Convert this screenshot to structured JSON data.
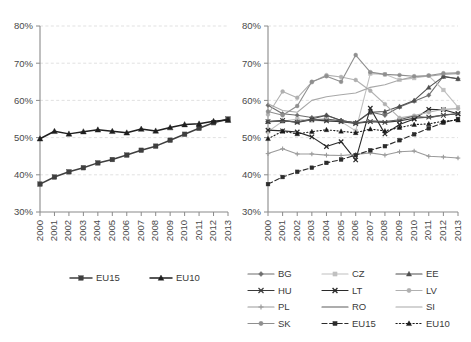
{
  "figure": {
    "background": "#ffffff",
    "axis_color": "#8a8a8a",
    "grid_color": "#d9d9d9"
  },
  "chart_data": [
    {
      "id": "left",
      "type": "line",
      "title": "",
      "xlabel": "",
      "ylabel": "",
      "x": [
        "2000",
        "2001",
        "2002",
        "2003",
        "2004",
        "2005",
        "2006",
        "2007",
        "2008",
        "2009",
        "2010",
        "2011",
        "2012",
        "2013"
      ],
      "ylim": [
        30,
        80
      ],
      "yticks": [
        30,
        40,
        50,
        60,
        70,
        80
      ],
      "ytick_labels": [
        "30%",
        "40%",
        "50%",
        "60%",
        "70%",
        "80%"
      ],
      "grid": true,
      "legend_position": "bottom",
      "series": [
        {
          "name": "EU15",
          "marker": "square",
          "color": "#3f3f3f",
          "dash": "none",
          "values": [
            37.5,
            39.4,
            40.8,
            41.9,
            43.2,
            44.1,
            45.3,
            46.6,
            47.7,
            49.3,
            50.9,
            52.5,
            54.0,
            55.0
          ]
        },
        {
          "name": "EU10",
          "marker": "triangle",
          "color": "#1f1f1f",
          "dash": "none",
          "values": [
            49.7,
            51.7,
            51.0,
            51.6,
            52.1,
            51.7,
            51.3,
            52.3,
            51.8,
            52.7,
            53.5,
            53.7,
            54.4,
            54.7
          ]
        }
      ]
    },
    {
      "id": "right",
      "type": "line",
      "title": "",
      "xlabel": "",
      "ylabel": "",
      "x": [
        "2000",
        "2001",
        "2002",
        "2003",
        "2004",
        "2005",
        "2006",
        "2007",
        "2008",
        "2009",
        "2010",
        "2011",
        "2012",
        "2013"
      ],
      "ylim": [
        30,
        80
      ],
      "yticks": [
        30,
        40,
        50,
        60,
        70,
        80
      ],
      "ytick_labels": [
        "30%",
        "40%",
        "50%",
        "60%",
        "70%",
        "80%"
      ],
      "grid": true,
      "legend_position": "bottom",
      "series": [
        {
          "name": "BG",
          "marker": "diamond",
          "color": "#6e6e6e",
          "dash": "none",
          "values": [
            58.7,
            56.4,
            56.0,
            55.4,
            56.0,
            54.6,
            54.0,
            56.9,
            56.0,
            58.2,
            59.8,
            61.4,
            66.5,
            65.8
          ]
        },
        {
          "name": "CZ",
          "marker": "square",
          "color": "#c0c0c0",
          "dash": "none",
          "values": [
            51.6,
            54.4,
            55.0,
            54.6,
            54.5,
            54.3,
            51.8,
            67.2,
            67.0,
            65.5,
            66.0,
            66.6,
            62.8,
            58.2
          ]
        },
        {
          "name": "EE",
          "marker": "triangle",
          "color": "#4f4f4f",
          "dash": "none",
          "values": [
            54.3,
            54.5,
            54.2,
            55.0,
            56.0,
            54.6,
            54.0,
            56.8,
            57.0,
            58.4,
            60.0,
            63.5,
            66.4,
            65.8
          ]
        },
        {
          "name": "HU",
          "marker": "cross",
          "color": "#3a3a3a",
          "dash": "none",
          "values": [
            54.3,
            54.6,
            54.1,
            54.8,
            54.5,
            54.3,
            53.8,
            54.3,
            54.1,
            54.5,
            55.2,
            55.5,
            56.0,
            56.4
          ]
        },
        {
          "name": "LT",
          "marker": "x",
          "color": "#2a2a2a",
          "dash": "none",
          "values": [
            52.0,
            51.8,
            51.5,
            50.2,
            47.6,
            48.9,
            44.0,
            57.9,
            51.0,
            53.5,
            55.0,
            57.6,
            57.5,
            56.4
          ]
        },
        {
          "name": "LV",
          "marker": "circle",
          "color": "#b0b0b0",
          "dash": "none",
          "values": [
            56.2,
            62.4,
            60.7,
            64.9,
            66.8,
            66.3,
            65.5,
            62.6,
            59.0,
            55.3,
            55.9,
            56.8,
            57.6,
            57.8
          ]
        },
        {
          "name": "PL",
          "marker": "plus",
          "color": "#9a9a9a",
          "dash": "none",
          "values": [
            45.7,
            47.0,
            45.6,
            45.6,
            45.3,
            45.2,
            45.5,
            45.9,
            45.3,
            46.2,
            46.4,
            45.0,
            44.8,
            44.5
          ]
        },
        {
          "name": "RO",
          "marker": "none",
          "color": "#5c5c5c",
          "dash": "none",
          "values": [
            54.3,
            54.4,
            54.3,
            54.8,
            55.0,
            54.5,
            53.9,
            54.5,
            54.3,
            54.8,
            55.8,
            55.3,
            56.1,
            56.4
          ]
        },
        {
          "name": "SI",
          "marker": "none",
          "color": "#a8a8a8",
          "dash": "none",
          "values": [
            59.1,
            57.3,
            56.8,
            60.0,
            61.0,
            61.5,
            62.0,
            63.5,
            64.2,
            65.5,
            66.4,
            66.5,
            67.0,
            67.2
          ]
        },
        {
          "name": "SK",
          "marker": "circle",
          "color": "#8f8f8f",
          "dash": "none",
          "values": [
            57.0,
            56.0,
            58.5,
            65.0,
            66.5,
            65.0,
            72.2,
            67.6,
            67.0,
            66.8,
            66.5,
            66.7,
            67.3,
            67.4
          ]
        },
        {
          "name": "EU15",
          "marker": "square",
          "color": "#2b2b2b",
          "dash": "dashed",
          "values": [
            37.5,
            39.4,
            40.8,
            41.9,
            43.2,
            44.1,
            45.3,
            46.6,
            47.7,
            49.3,
            50.9,
            52.5,
            54.0,
            55.0
          ]
        },
        {
          "name": "EU10",
          "marker": "triangle",
          "color": "#1a1a1a",
          "dash": "dotted",
          "values": [
            49.7,
            51.7,
            51.0,
            51.6,
            52.1,
            51.7,
            51.3,
            52.3,
            51.8,
            52.7,
            53.5,
            53.7,
            54.4,
            54.7
          ]
        }
      ]
    }
  ]
}
